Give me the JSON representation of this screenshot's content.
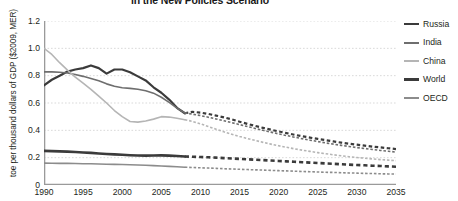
{
  "chart_title": "in the New Policies Scenario",
  "axes": {
    "ylabel": "toe per thousand dollars of GDP ($2009, MER)",
    "xlabel": "",
    "yticks": [
      "1.2",
      "1.0",
      "0.8",
      "0.6",
      "0.4",
      "0.2",
      "0"
    ],
    "xticks": [
      "1990",
      "1995",
      "2000",
      "2005",
      "2010",
      "2015",
      "2020",
      "2025",
      "2030",
      "2035"
    ]
  },
  "legend": {
    "position": "right",
    "items": [
      {
        "label": "Russia",
        "color": "#3b3b3b",
        "width": 2.2
      },
      {
        "label": "India",
        "color": "#6e6e6e",
        "width": 1.6
      },
      {
        "label": "China",
        "color": "#b5b5b5",
        "width": 1.6
      },
      {
        "label": "World",
        "color": "#3b3b3b",
        "width": 2.6
      },
      {
        "label": "OECD",
        "color": "#8c8c8c",
        "width": 1.6
      }
    ]
  },
  "chart_data": {
    "type": "line",
    "title": "in the New Policies Scenario",
    "xlabel": "",
    "ylabel": "toe per thousand dollars of GDP ($2009, MER)",
    "xlim": [
      1990,
      2035
    ],
    "ylim": [
      0,
      1.2
    ],
    "grid": true,
    "grid_axis": "y",
    "history_end_year": 2008,
    "projection_style": "dashed",
    "x": [
      1990,
      1991,
      1992,
      1993,
      1994,
      1995,
      1996,
      1997,
      1998,
      1999,
      2000,
      2001,
      2002,
      2003,
      2004,
      2005,
      2006,
      2007,
      2008,
      2009,
      2010,
      2011,
      2012,
      2013,
      2014,
      2015,
      2016,
      2017,
      2018,
      2019,
      2020,
      2021,
      2022,
      2023,
      2024,
      2025,
      2026,
      2027,
      2028,
      2029,
      2030,
      2031,
      2032,
      2033,
      2034,
      2035
    ],
    "series": [
      {
        "name": "Russia",
        "color": "#3b3b3b",
        "values": [
          0.73,
          0.77,
          0.8,
          0.83,
          0.845,
          0.855,
          0.875,
          0.855,
          0.815,
          0.845,
          0.845,
          0.825,
          0.795,
          0.765,
          0.715,
          0.675,
          0.625,
          0.565,
          0.525,
          0.535,
          0.53,
          0.52,
          0.508,
          0.495,
          0.48,
          0.463,
          0.447,
          0.432,
          0.418,
          0.405,
          0.392,
          0.38,
          0.368,
          0.357,
          0.347,
          0.337,
          0.328,
          0.319,
          0.31,
          0.302,
          0.295,
          0.288,
          0.281,
          0.275,
          0.269,
          0.263
        ]
      },
      {
        "name": "India",
        "color": "#6e6e6e",
        "values": [
          0.828,
          0.828,
          0.825,
          0.82,
          0.808,
          0.795,
          0.78,
          0.762,
          0.74,
          0.722,
          0.712,
          0.707,
          0.7,
          0.69,
          0.672,
          0.642,
          0.605,
          0.562,
          0.528,
          0.518,
          0.508,
          0.496,
          0.483,
          0.47,
          0.456,
          0.442,
          0.428,
          0.414,
          0.4,
          0.387,
          0.374,
          0.362,
          0.35,
          0.339,
          0.328,
          0.318,
          0.308,
          0.299,
          0.29,
          0.282,
          0.274,
          0.267,
          0.26,
          0.253,
          0.247,
          0.241
        ]
      },
      {
        "name": "China",
        "color": "#b5b5b5",
        "values": [
          1.0,
          0.955,
          0.895,
          0.84,
          0.79,
          0.745,
          0.7,
          0.65,
          0.6,
          0.545,
          0.5,
          0.465,
          0.46,
          0.468,
          0.482,
          0.5,
          0.497,
          0.488,
          0.478,
          0.465,
          0.448,
          0.428,
          0.408,
          0.389,
          0.372,
          0.355,
          0.34,
          0.326,
          0.312,
          0.299,
          0.287,
          0.276,
          0.265,
          0.255,
          0.246,
          0.237,
          0.229,
          0.221,
          0.214,
          0.207,
          0.201,
          0.196,
          0.191,
          0.186,
          0.182,
          0.178
        ]
      },
      {
        "name": "World",
        "color": "#3b3b3b",
        "values": [
          0.25,
          0.248,
          0.246,
          0.244,
          0.241,
          0.238,
          0.235,
          0.231,
          0.227,
          0.224,
          0.221,
          0.218,
          0.216,
          0.215,
          0.216,
          0.217,
          0.215,
          0.212,
          0.208,
          0.207,
          0.205,
          0.203,
          0.2,
          0.197,
          0.194,
          0.191,
          0.188,
          0.185,
          0.182,
          0.179,
          0.176,
          0.173,
          0.17,
          0.167,
          0.164,
          0.161,
          0.158,
          0.155,
          0.152,
          0.149,
          0.146,
          0.144,
          0.141,
          0.139,
          0.136,
          0.134
        ]
      },
      {
        "name": "OECD",
        "color": "#8c8c8c",
        "values": [
          0.16,
          0.159,
          0.158,
          0.158,
          0.157,
          0.156,
          0.155,
          0.154,
          0.152,
          0.151,
          0.15,
          0.148,
          0.146,
          0.144,
          0.142,
          0.139,
          0.136,
          0.133,
          0.13,
          0.128,
          0.126,
          0.124,
          0.122,
          0.119,
          0.117,
          0.115,
          0.113,
          0.111,
          0.109,
          0.107,
          0.105,
          0.103,
          0.101,
          0.099,
          0.097,
          0.095,
          0.093,
          0.092,
          0.09,
          0.088,
          0.087,
          0.085,
          0.084,
          0.082,
          0.081,
          0.08
        ]
      }
    ]
  }
}
